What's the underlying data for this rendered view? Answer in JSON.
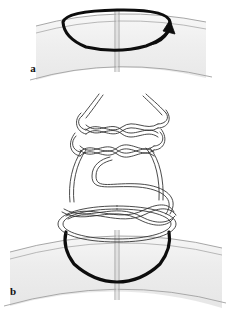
{
  "figure": {
    "panels": [
      {
        "id": "a",
        "label": "a",
        "label_x": 33,
        "label_y": 72,
        "description": "Loop of suture passed through tissue edges with needle direction arrow",
        "elements": {
          "tissue_band": "curved tissue band with incision seam",
          "suture_loop": "single thick black suture loop",
          "arrow": "directional arrow showing suture pull"
        }
      },
      {
        "id": "b",
        "label": "b",
        "label_x": 13,
        "label_y": 295,
        "description": "Completed multi-throw braided knot above the approximated tissue edges",
        "elements": {
          "tissue_band": "curved tissue band with incision seam",
          "suture_loop": "thick black suture loop at tissue surface",
          "knot_throws": "stacked interlaced suture throws forming the knot",
          "strand_tails": "two free suture tails exiting the top of the knot"
        }
      }
    ],
    "colors": {
      "suture_stroke": "#0d0d0d",
      "tissue_fill_light": "#f4f4f4",
      "tissue_fill_mid": "#ebebeb",
      "tissue_line": "#9a9a9a",
      "seam_line": "#8c8c8c",
      "thread_stroke": "#2a2a2a",
      "background": "#ffffff",
      "label_color": "#111111"
    },
    "geometry": {
      "canvas_width": 229,
      "canvas_height": 312,
      "panel_a_band_top": 12,
      "panel_a_band_bottom": 78,
      "panel_b_band_top": 228,
      "panel_b_band_bottom": 300,
      "seam_x": 117,
      "knot_top_y": 96,
      "knot_bottom_y": 232
    }
  }
}
